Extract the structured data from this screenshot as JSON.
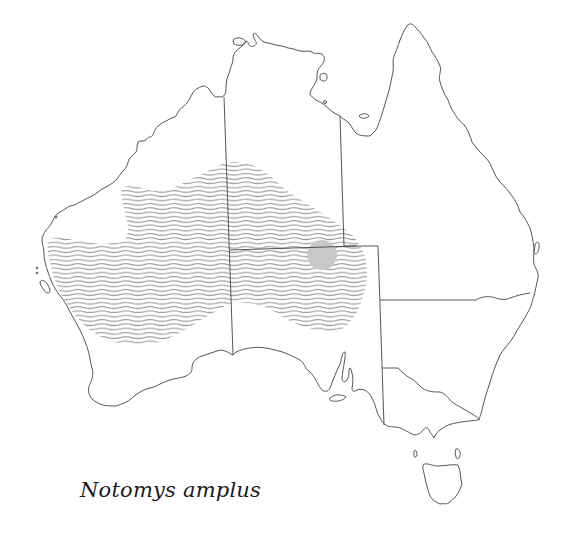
{
  "map": {
    "subject": "Australia",
    "species_name": "Notomys amplus",
    "range_style": "wavy-hatched",
    "range_color": "#9a9a9a",
    "record_marker_color": "#c8c8c8",
    "coast_color": "#555555",
    "border_color": "#444444",
    "background": "#ffffff",
    "legend": {
      "hatched_area": "distribution range",
      "grey_circle": "record locality"
    }
  },
  "caption": {
    "text": "Notomys amplus"
  }
}
